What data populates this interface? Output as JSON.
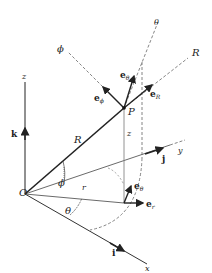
{
  "figure": {
    "origin_label": "O",
    "point_label": "P",
    "axes": {
      "x": "x",
      "y": "y",
      "z": "z"
    },
    "unit_vectors": {
      "i": "i",
      "j": "j",
      "k": "k"
    },
    "lines": {
      "R_line": "R",
      "R_direction": "R",
      "theta_direction": "θ",
      "phi_direction": "ϕ",
      "z_height": "z",
      "r_projection": "r"
    },
    "angles": {
      "phi": "ϕ",
      "theta": "θ"
    },
    "basis_at_P": {
      "e_theta": {
        "base": "e",
        "sub": "θ"
      },
      "e_phi": {
        "base": "e",
        "sub": "ϕ"
      },
      "e_R": {
        "base": "e",
        "sub": "R"
      }
    },
    "basis_at_base": {
      "e_theta": {
        "base": "e",
        "sub": "θ"
      },
      "e_r": {
        "base": "e",
        "sub": "r"
      }
    },
    "colors": {
      "line": "#222222",
      "dashed": "#555555",
      "background": "#ffffff"
    }
  }
}
